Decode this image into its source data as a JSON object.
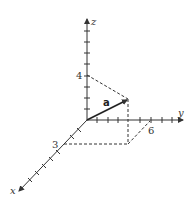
{
  "diagram": {
    "type": "3d-vector",
    "axes": {
      "x": {
        "label": "x"
      },
      "y": {
        "label": "y"
      },
      "z": {
        "label": "z"
      }
    },
    "vector": {
      "label": "a",
      "components": [
        3,
        6,
        4
      ]
    },
    "tick_labels": {
      "x": "3",
      "y": "6",
      "z": "4"
    },
    "colors": {
      "axis": "#333333",
      "vector": "#222222",
      "dashed": "#333333"
    }
  }
}
